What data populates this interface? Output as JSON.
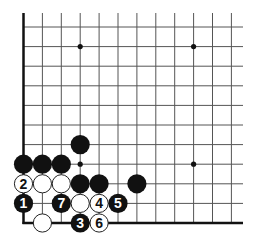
{
  "diagram": {
    "type": "go-board-fragment",
    "corner": "bottom-left",
    "grid": {
      "columns": 12,
      "rows": 11,
      "x0": 23.5,
      "dx": 18.9,
      "y0": 27,
      "dy": 19.6,
      "line_top": 13,
      "line_right": 243,
      "line_color": "#555555",
      "edge_color": "#111111"
    },
    "star_points": [
      {
        "col": 3,
        "row": 1
      },
      {
        "col": 9,
        "row": 1
      },
      {
        "col": 3,
        "row": 7
      },
      {
        "col": 9,
        "row": 7
      }
    ],
    "stones": [
      {
        "col": 3,
        "row": 6,
        "color": "black",
        "label": ""
      },
      {
        "col": 0,
        "row": 7,
        "color": "black",
        "label": ""
      },
      {
        "col": 1,
        "row": 7,
        "color": "black",
        "label": ""
      },
      {
        "col": 2,
        "row": 7,
        "color": "black",
        "label": ""
      },
      {
        "col": 0,
        "row": 8,
        "color": "white",
        "label": "2"
      },
      {
        "col": 1,
        "row": 8,
        "color": "white",
        "label": ""
      },
      {
        "col": 2,
        "row": 8,
        "color": "white",
        "label": ""
      },
      {
        "col": 3,
        "row": 8,
        "color": "black",
        "label": ""
      },
      {
        "col": 4,
        "row": 8,
        "color": "black",
        "label": ""
      },
      {
        "col": 6,
        "row": 8,
        "color": "black",
        "label": ""
      },
      {
        "col": 0,
        "row": 9,
        "color": "black",
        "label": "1"
      },
      {
        "col": 2,
        "row": 9,
        "color": "black",
        "label": "7"
      },
      {
        "col": 3,
        "row": 9,
        "color": "white",
        "label": ""
      },
      {
        "col": 4,
        "row": 9,
        "color": "white",
        "label": "4"
      },
      {
        "col": 5,
        "row": 9,
        "color": "black",
        "label": "5"
      },
      {
        "col": 1,
        "row": 10,
        "color": "white",
        "label": ""
      },
      {
        "col": 3,
        "row": 10,
        "color": "black",
        "label": "3"
      },
      {
        "col": 4,
        "row": 10,
        "color": "white",
        "label": "6"
      }
    ],
    "colors": {
      "black_stone": "#111111",
      "white_stone": "#ffffff",
      "white_stone_border": "#222222",
      "black_label": "#ffffff",
      "white_label": "#111111"
    }
  }
}
